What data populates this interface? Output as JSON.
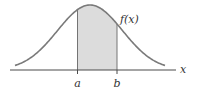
{
  "diagram": {
    "type": "normal-distribution-area",
    "curve_label": "f(x)",
    "axis_label": "x",
    "bounds": {
      "lower": "a",
      "upper": "b"
    },
    "colors": {
      "curve": "#7a7a7a",
      "axis": "#4a4a4a",
      "shade": "#dcdcdc",
      "text": "#333333"
    },
    "geometry": {
      "mean_px": 90,
      "peak_y": 5,
      "baseline_y": 70,
      "sigma_px": 32.5,
      "curve_x_range": [
        15,
        165
      ],
      "axis_x_range": [
        10,
        176
      ],
      "a_px": 77.5,
      "b_px": 117
    }
  }
}
